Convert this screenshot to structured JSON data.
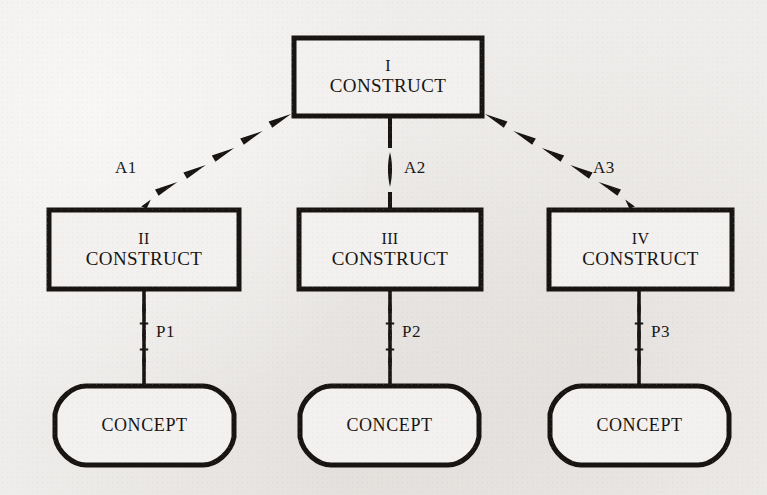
{
  "diagram": {
    "type": "hierarchy-diagram",
    "background_color": "#efedeb",
    "ink_color": "#171412",
    "root": {
      "roman": "I",
      "word": "CONSTRUCT"
    },
    "constructs": [
      {
        "roman": "II",
        "word": "CONSTRUCT"
      },
      {
        "roman": "III",
        "word": "CONSTRUCT"
      },
      {
        "roman": "IV",
        "word": "CONSTRUCT"
      }
    ],
    "concepts": [
      {
        "word": "CONCEPT"
      },
      {
        "word": "CONCEPT"
      },
      {
        "word": "CONCEPT"
      }
    ],
    "axiom_edges": [
      {
        "label": "A1",
        "style": "dashed-diagonal-left"
      },
      {
        "label": "A2",
        "style": "dashed-vertical"
      },
      {
        "label": "A3",
        "style": "dashed-diagonal-right"
      }
    ],
    "proposition_edges": [
      {
        "label": "P1",
        "style": "beaded-vertical"
      },
      {
        "label": "P2",
        "style": "beaded-vertical"
      },
      {
        "label": "P3",
        "style": "beaded-vertical"
      }
    ]
  }
}
